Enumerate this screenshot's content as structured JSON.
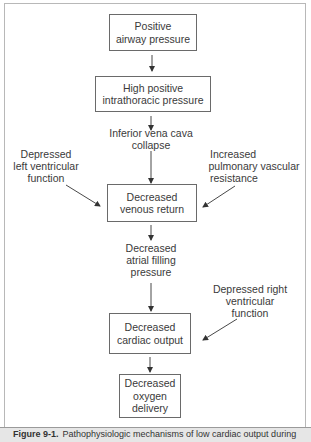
{
  "diagram": {
    "boxes": [
      {
        "id": "positive-airway-pressure",
        "lines": [
          "Positive",
          "airway pressure"
        ]
      },
      {
        "id": "high-positive-intrathoracic-pressure",
        "lines": [
          "High positive",
          "intrathoracic pressure"
        ]
      },
      {
        "id": "decreased-venous-return",
        "lines": [
          "Decreased",
          "venous return"
        ]
      },
      {
        "id": "decreased-cardiac-output",
        "lines": [
          "Decreased",
          "cardiac output"
        ]
      },
      {
        "id": "decreased-oxygen-delivery",
        "lines": [
          "Decreased",
          "oxygen",
          "delivery"
        ]
      }
    ],
    "labels": [
      {
        "id": "inferior-vena-cava-collapse",
        "lines": [
          "Inferior vena cava",
          "collapse"
        ]
      },
      {
        "id": "depressed-left-ventricular-function",
        "lines": [
          "Depressed",
          "left ventricular",
          "function"
        ]
      },
      {
        "id": "increased-pulmonary-vascular-resistance",
        "lines": [
          "Increased",
          "pulmonary vascular",
          "resistance"
        ]
      },
      {
        "id": "decreased-atrial-filling-pressure",
        "lines": [
          "Decreased",
          "atrial filling",
          "pressure"
        ]
      },
      {
        "id": "depressed-right-ventricular-function",
        "lines": [
          "Depressed right",
          "ventricular",
          "function"
        ]
      }
    ],
    "edges": [
      {
        "from": "positive-airway-pressure",
        "to": "high-positive-intrathoracic-pressure"
      },
      {
        "from": "high-positive-intrathoracic-pressure",
        "to": "inferior-vena-cava-collapse"
      },
      {
        "from": "inferior-vena-cava-collapse",
        "to": "decreased-venous-return"
      },
      {
        "from": "depressed-left-ventricular-function",
        "to": "decreased-venous-return"
      },
      {
        "from": "increased-pulmonary-vascular-resistance",
        "to": "decreased-venous-return"
      },
      {
        "from": "decreased-venous-return",
        "to": "decreased-atrial-filling-pressure"
      },
      {
        "from": "decreased-atrial-filling-pressure",
        "to": "decreased-cardiac-output"
      },
      {
        "from": "depressed-right-ventricular-function",
        "to": "decreased-cardiac-output"
      },
      {
        "from": "decreased-cardiac-output",
        "to": "decreased-oxygen-delivery"
      }
    ]
  },
  "caption": {
    "figure_label": "Figure 9-1.",
    "text": "Pathophysiologic mechanisms of low cardiac output during"
  }
}
